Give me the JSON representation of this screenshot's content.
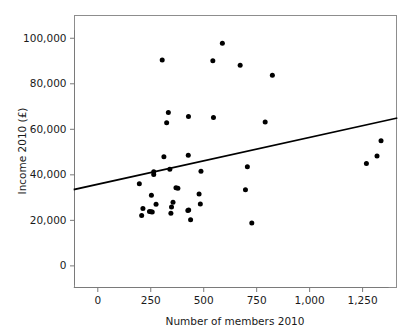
{
  "figure": {
    "corner_mark": "",
    "background_color": "#ffffff",
    "point_color": "#000000",
    "line_color": "#000000",
    "axis_color": "#7a7a7a"
  },
  "chart_data": {
    "type": "scatter",
    "title": "",
    "xlabel": "Number of members 2010",
    "ylabel": "Income 2010 (£)",
    "xlim": [
      -110,
      1410
    ],
    "ylim": [
      -9500,
      110000
    ],
    "grid": false,
    "legend": null,
    "xticks": [
      0,
      250,
      500,
      750,
      1000,
      1250
    ],
    "xticklabels": [
      "0",
      "250",
      "500",
      "750",
      "1,000",
      "1,250"
    ],
    "yticks": [
      0,
      20000,
      40000,
      60000,
      80000,
      100000
    ],
    "yticklabels": [
      "0",
      "20,000",
      "40,000",
      "60,000",
      "80,000",
      "100,000"
    ],
    "points": [
      {
        "x": 588,
        "y": 97800
      },
      {
        "x": 304,
        "y": 90400
      },
      {
        "x": 543,
        "y": 90100
      },
      {
        "x": 672,
        "y": 88100
      },
      {
        "x": 824,
        "y": 83700
      },
      {
        "x": 333,
        "y": 67400
      },
      {
        "x": 428,
        "y": 65600
      },
      {
        "x": 546,
        "y": 65200
      },
      {
        "x": 325,
        "y": 62900
      },
      {
        "x": 790,
        "y": 63200
      },
      {
        "x": 1337,
        "y": 55000
      },
      {
        "x": 1318,
        "y": 48300
      },
      {
        "x": 1268,
        "y": 45000
      },
      {
        "x": 427,
        "y": 48600
      },
      {
        "x": 312,
        "y": 47900
      },
      {
        "x": 706,
        "y": 43500
      },
      {
        "x": 340,
        "y": 42500
      },
      {
        "x": 487,
        "y": 41600
      },
      {
        "x": 264,
        "y": 41400
      },
      {
        "x": 264,
        "y": 40100
      },
      {
        "x": 196,
        "y": 36100
      },
      {
        "x": 369,
        "y": 34300
      },
      {
        "x": 378,
        "y": 34100
      },
      {
        "x": 697,
        "y": 33500
      },
      {
        "x": 253,
        "y": 31000
      },
      {
        "x": 478,
        "y": 31600
      },
      {
        "x": 484,
        "y": 27200
      },
      {
        "x": 275,
        "y": 27100
      },
      {
        "x": 355,
        "y": 28000
      },
      {
        "x": 348,
        "y": 25900
      },
      {
        "x": 213,
        "y": 25200
      },
      {
        "x": 429,
        "y": 24500
      },
      {
        "x": 425,
        "y": 24300
      },
      {
        "x": 244,
        "y": 23900
      },
      {
        "x": 251,
        "y": 23800
      },
      {
        "x": 257,
        "y": 23700
      },
      {
        "x": 345,
        "y": 23100
      },
      {
        "x": 207,
        "y": 22100
      },
      {
        "x": 438,
        "y": 20300
      },
      {
        "x": 727,
        "y": 18800
      }
    ],
    "fit_line": {
      "x_start": -110,
      "y_start": 33600,
      "x_end": 1410,
      "y_end": 64900
    }
  }
}
